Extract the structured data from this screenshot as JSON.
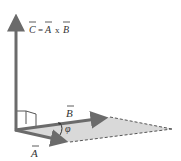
{
  "diagram": {
    "equation": {
      "lhs": "C",
      "equals": "=",
      "a": "A",
      "op": "x",
      "b": "B"
    },
    "vectors": [
      {
        "name": "C",
        "label": "C",
        "description": "result vector perpendicular to plane"
      },
      {
        "name": "A",
        "label": "A"
      },
      {
        "name": "B",
        "label": "B"
      }
    ],
    "angle_label": "φ",
    "colors": {
      "vector": "#6b6b6b",
      "plane": "#d6d6d6",
      "dashed_edge": "#555555",
      "text": "#333333"
    }
  }
}
